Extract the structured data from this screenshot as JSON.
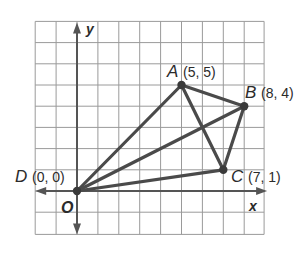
{
  "diagram": {
    "type": "coordinate-plane",
    "grid": {
      "x_min": -2,
      "x_max": 9,
      "y_min": -2,
      "y_max": 8,
      "line_color": "#9a9a9a",
      "axis_color": "#555555"
    },
    "axes": {
      "x_label": "x",
      "y_label": "y",
      "origin_label": "O"
    },
    "points": [
      {
        "name": "A",
        "coord_text": "(5, 5)",
        "x": 5,
        "y": 5
      },
      {
        "name": "B",
        "coord_text": "(8, 4)",
        "x": 8,
        "y": 4
      },
      {
        "name": "C",
        "coord_text": "(7, 1)",
        "x": 7,
        "y": 1
      },
      {
        "name": "D",
        "coord_text": "(0, 0)",
        "x": 0,
        "y": 0
      }
    ],
    "segments": [
      [
        "D",
        "A"
      ],
      [
        "D",
        "B"
      ],
      [
        "D",
        "C"
      ],
      [
        "A",
        "B"
      ],
      [
        "A",
        "C"
      ],
      [
        "B",
        "C"
      ]
    ],
    "segment_color": "#4a4a4a"
  }
}
